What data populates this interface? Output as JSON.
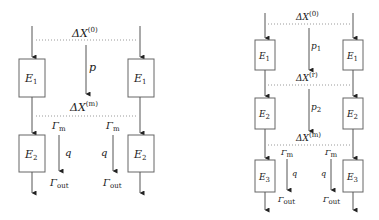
{
  "diagrams": [
    {
      "name": "two-stage-model",
      "top_delta": {
        "base": "ΔX",
        "sup": "(0)"
      },
      "mid_delta": {
        "base": "ΔX",
        "sup": "(m)"
      },
      "transfer_label": "p",
      "boxes": [
        {
          "base": "E",
          "sub": "1"
        },
        {
          "base": "E",
          "sub": "2"
        }
      ],
      "gamma_m": {
        "base": "Γ",
        "sub": "m"
      },
      "q_label": "q",
      "gamma_out": {
        "base": "Γ",
        "sub": "out"
      }
    },
    {
      "name": "three-stage-model",
      "top_delta": {
        "base": "ΔX",
        "sup": "(0)"
      },
      "r_delta": {
        "base": "ΔX",
        "sup": "(r)"
      },
      "mid_delta": {
        "base": "ΔX",
        "sup": "(m)"
      },
      "transfer_labels": [
        {
          "base": "p",
          "sub": "1"
        },
        {
          "base": "p",
          "sub": "2"
        }
      ],
      "boxes": [
        {
          "base": "E",
          "sub": "1"
        },
        {
          "base": "E",
          "sub": "2"
        },
        {
          "base": "E",
          "sub": "3"
        }
      ],
      "gamma_m": {
        "base": "Γ",
        "sub": "m"
      },
      "q_label": "q",
      "gamma_out": {
        "base": "Γ",
        "sub": "out"
      }
    }
  ],
  "colors": {
    "line": "#555555",
    "dotted": "#9a9a9a",
    "box_stroke": "#666666"
  }
}
